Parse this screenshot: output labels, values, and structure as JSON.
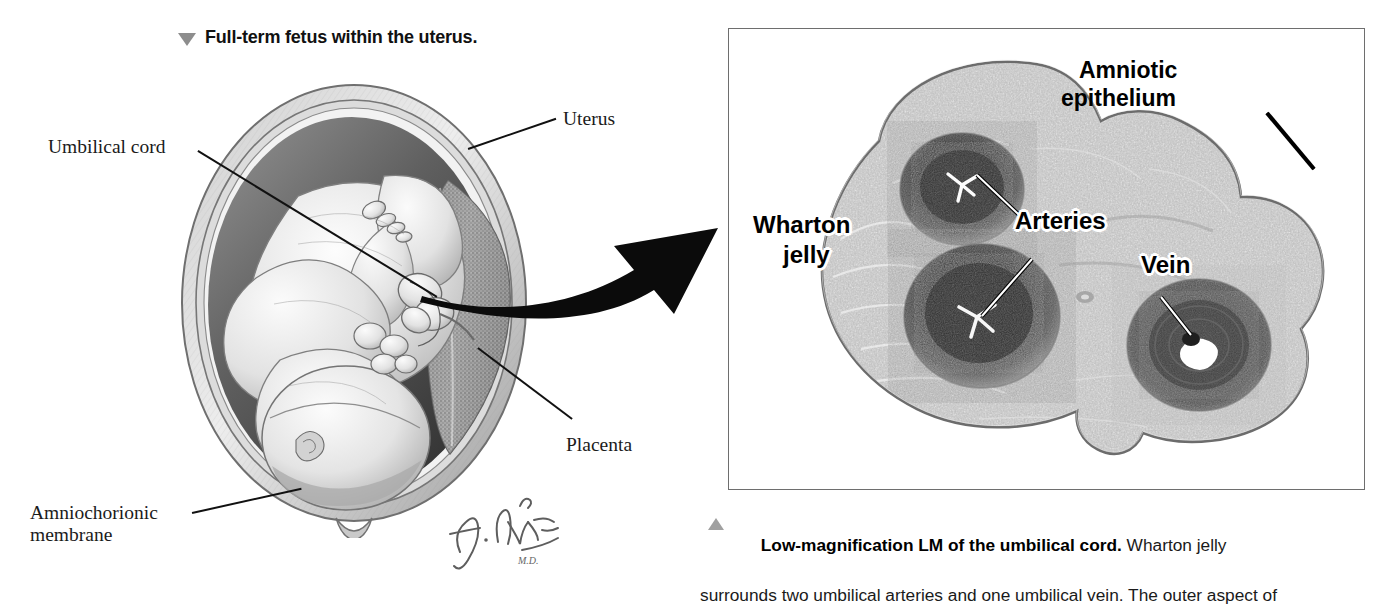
{
  "figure_left": {
    "heading": "Full-term fetus within the uterus.",
    "heading_marker_icon": "triangle-down-icon",
    "labels": [
      {
        "id": "umbilical-cord",
        "text": "Umbilical cord"
      },
      {
        "id": "uterus",
        "text": "Uterus"
      },
      {
        "id": "placenta",
        "text": "Placenta"
      },
      {
        "id": "amniochorionic-membrane-line1",
        "text": "Amniochorionic"
      },
      {
        "id": "amniochorionic-membrane-line2",
        "text": "membrane"
      }
    ],
    "artist_signature": "F. Netter, M.D.",
    "illustration_alt": "Pencil drawing of a full-term fetus curled head-down inside a sectioned uterus with placenta on the right wall"
  },
  "figure_right": {
    "panel_border_color": "#6e6e6e",
    "labels": [
      {
        "id": "amniotic-epithelium-line1",
        "text": "Amniotic"
      },
      {
        "id": "amniotic-epithelium-line2",
        "text": "epithelium"
      },
      {
        "id": "arteries",
        "text": "Arteries"
      },
      {
        "id": "wharton-jelly-line1",
        "text": "Wharton"
      },
      {
        "id": "wharton-jelly-line2",
        "text": "jelly"
      },
      {
        "id": "vein",
        "text": "Vein"
      }
    ],
    "micrograph_alt": "Low-magnification light micrograph of a transverse section of umbilical cord showing two dark arteries and one vein in pale Wharton jelly"
  },
  "connector": {
    "icon": "curved-arrow-icon",
    "description": "Thick black curved arrow from the umbilical cord in the left illustration to the micrograph panel"
  },
  "caption": {
    "marker_icon": "triangle-up-icon",
    "bold_lead": "Low-magnification LM of the umbilical cord.",
    "line1_rest": " Wharton jelly",
    "line2": "surrounds two umbilical arteries and one umbilical vein. The outer aspect of"
  }
}
